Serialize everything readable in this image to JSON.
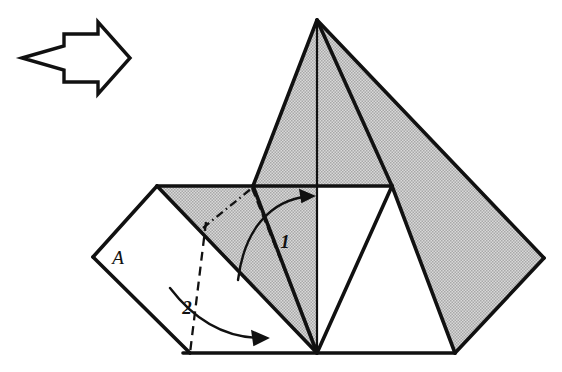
{
  "figure": {
    "kind": "origami-fold-diagram",
    "canvas": {
      "width": 562,
      "height": 372
    },
    "background_color": "#ffffff",
    "ink_color": "#111111",
    "shade_color": "#c9c9c9",
    "shade_dot_color": "#8c8c8c",
    "paper_white_color": "#ffffff"
  },
  "step_arrow": {
    "name": "proceed-arrow",
    "description": "hollow concave-tail arrow pointing right",
    "points": "22,58 64,46 64,34 98,34 98,22 130,58 98,94 98,82 64,82 64,70",
    "stroke_width": 3.4
  },
  "labels": {
    "flap": {
      "text": "A",
      "x": 118,
      "y": 264
    },
    "fold_one": {
      "text": "1",
      "x": 285,
      "y": 248
    },
    "fold_two": {
      "text": "2",
      "x": 187,
      "y": 314
    }
  },
  "shapes": {
    "tall_peak_left": {
      "name": "tall-peak-left-face",
      "points": "317,20 253,186 317,186",
      "fill": "shaded"
    },
    "tall_peak_right": {
      "name": "tall-peak-right-face",
      "points": "317,20 392,186 317,186",
      "fill": "shaded"
    },
    "right_wing": {
      "name": "right-wing-flap",
      "points": "317,20 544,258 455,353 392,186",
      "fill": "shaded"
    },
    "left_shaded_band": {
      "name": "left-shaded-band",
      "points": "157,186 253,186 317,353 230,353",
      "fill": "shaded"
    },
    "mid_left_shaded": {
      "name": "mid-left-shaded-face",
      "points": "253,186 317,186 317,353",
      "fill": "shaded"
    },
    "inner_white_triangle": {
      "name": "inner-white-triangle",
      "points": "317,353 392,186 455,353",
      "fill": "white"
    },
    "mid_white_wedge": {
      "name": "mid-white-wedge",
      "points": "317,186 392,186 317,353",
      "fill": "white"
    },
    "white_flap_a": {
      "name": "white-flap-a",
      "points": "157,186 93,257 190,353 317,353",
      "fill": "white"
    }
  },
  "edges": [
    {
      "name": "peak-left-edge",
      "d": "M317,20 L253,186",
      "weight": "heavy"
    },
    {
      "name": "peak-right-edge",
      "d": "M317,20 L392,186",
      "weight": "heavy"
    },
    {
      "name": "peak-center-spine",
      "d": "M317,20 L317,186",
      "weight": "medium"
    },
    {
      "name": "peak-thin-crease",
      "d": "M317,20 L392,186",
      "weight": "thin"
    },
    {
      "name": "right-wing-top-edge",
      "d": "M317,20 L544,258",
      "weight": "heavy"
    },
    {
      "name": "right-wing-bottom-edge",
      "d": "M544,258 L455,353",
      "weight": "heavy"
    },
    {
      "name": "right-wing-inner-edge",
      "d": "M392,186 L455,353",
      "weight": "heavy"
    },
    {
      "name": "top-horizontal-edge",
      "d": "M157,186 L392,186",
      "weight": "heavy"
    },
    {
      "name": "center-vertical-crease",
      "d": "M317,186 L317,353",
      "weight": "medium"
    },
    {
      "name": "mid-left-crease",
      "d": "M253,186 L317,353",
      "weight": "heavy"
    },
    {
      "name": "mid-right-crease",
      "d": "M392,186 L317,353",
      "weight": "heavy"
    },
    {
      "name": "flap-upper-left-edge",
      "d": "M157,186 L93,257",
      "weight": "heavy"
    },
    {
      "name": "flap-lower-left-edge",
      "d": "M93,257 L190,353",
      "weight": "heavy"
    },
    {
      "name": "flap-diagonal-crease",
      "d": "M157,186 L317,353",
      "weight": "heavy"
    },
    {
      "name": "bottom-edge",
      "d": "M183,353 L455,353",
      "weight": "heavy"
    }
  ],
  "fold_lines": [
    {
      "name": "valley-fold-1-dashed",
      "d": "M252,188 L317,351",
      "style": "dashed",
      "dasharray": "9,5"
    },
    {
      "name": "mountain-fold-dash-dot",
      "d": "M203,228 L252,188",
      "style": "dash-dot",
      "dasharray": "8,4,1.5,4"
    },
    {
      "name": "valley-fold-2-dashed",
      "d": "M206,222 L190,353",
      "style": "dashed",
      "dasharray": "9,6"
    }
  ],
  "fold_arrows": [
    {
      "name": "fold-arrow-1",
      "d": "M238,280 C244,232 268,200 310,196",
      "head": "314,196 300,190 302,202"
    },
    {
      "name": "fold-arrow-2",
      "d": "M170,288 C196,322 228,338 262,338",
      "head": "268,338 252,331 254,345"
    }
  ]
}
